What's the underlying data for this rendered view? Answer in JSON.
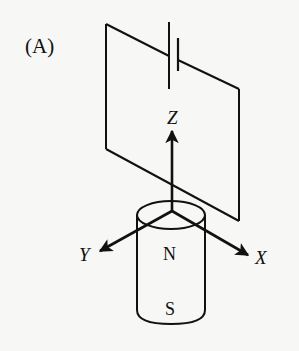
{
  "figure": {
    "panel_label": "(A)",
    "circuit": {
      "shape": "rectangular wire loop (perspective)",
      "component": "battery"
    },
    "axes": {
      "z_label": "Z",
      "y_label": "Y",
      "x_label": "X"
    },
    "magnet": {
      "north_label": "N",
      "south_label": "S"
    },
    "colors": {
      "ink": "#111111",
      "background": "#f7f7f5"
    }
  }
}
